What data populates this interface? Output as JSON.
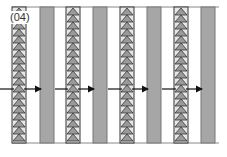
{
  "figure": {
    "label": "(04)",
    "colors": {
      "triangle_fill": "#9a9a9a",
      "triangle_stroke": "#333333",
      "triangle_bg": "#e6e6e6",
      "plain_column_fill": "#a6a6a6",
      "plain_column_stroke": "#777777",
      "arrow": "#111111",
      "frame": "#888888"
    },
    "columns": [
      {
        "type": "triangles"
      },
      {
        "type": "plain"
      },
      {
        "type": "triangles"
      },
      {
        "type": "plain"
      },
      {
        "type": "triangles"
      },
      {
        "type": "plain"
      },
      {
        "type": "triangles"
      },
      {
        "type": "plain"
      }
    ],
    "arrows": [
      {
        "from": 0,
        "to": 1
      },
      {
        "from": 2,
        "to": 3
      },
      {
        "from": 4,
        "to": 5
      },
      {
        "from": 6,
        "to": 7
      }
    ],
    "incoming_arrows": [
      0,
      2,
      4,
      6
    ]
  }
}
